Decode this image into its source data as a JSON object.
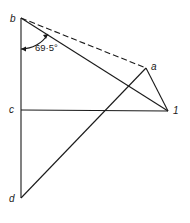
{
  "diagram": {
    "labels": {
      "b": "b",
      "c": "c",
      "d": "d",
      "a": "a",
      "one": "1"
    },
    "angle_label": "69·5°",
    "points": {
      "b": [
        21,
        18
      ],
      "c": [
        21,
        110
      ],
      "d": [
        21,
        198
      ],
      "a": [
        146,
        68
      ],
      "one": [
        168,
        111
      ]
    },
    "edges": [
      {
        "from": "b",
        "to": "d",
        "style": "solid"
      },
      {
        "from": "b",
        "to": "a",
        "style": "dashed"
      },
      {
        "from": "b",
        "to": "one",
        "style": "solid"
      },
      {
        "from": "a",
        "to": "one",
        "style": "solid"
      },
      {
        "from": "c",
        "to": "one",
        "style": "solid"
      },
      {
        "from": "d",
        "to": "a",
        "style": "solid"
      }
    ],
    "line_color": "#1a1a1a"
  }
}
